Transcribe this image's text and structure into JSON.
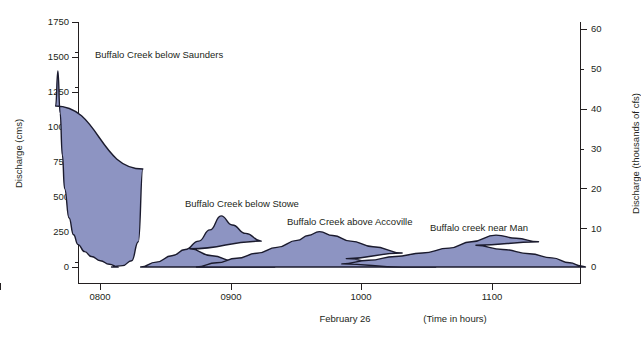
{
  "chart_data": {
    "type": "area",
    "title": "",
    "xlabel": "February 26",
    "xlabel_units": "(Time in hours)",
    "ylabel": "Discharge (cms)",
    "ylabel_right": "Discharge (thousands of cfs)",
    "xlim": [
      770,
      1155
    ],
    "ylim": [
      0,
      1750
    ],
    "ylim_right": [
      0,
      60
    ],
    "grid": false,
    "legend_position": "inline-annotations",
    "x_tick_labels": [
      "0800",
      "0900",
      "1000",
      "1100"
    ],
    "x_tick_values": [
      800,
      900,
      1000,
      1100
    ],
    "y_tick_labels": [
      "0",
      "250",
      "500",
      "750",
      "1000",
      "1250",
      "1500",
      "1750"
    ],
    "y_tick_values": [
      0,
      250,
      500,
      750,
      1000,
      1250,
      1500,
      1750
    ],
    "y_right_tick_labels": [
      "0",
      "10",
      "20",
      "30",
      "40",
      "50",
      "60"
    ],
    "y_right_tick_values": [
      0,
      10,
      20,
      30,
      40,
      50,
      60
    ],
    "fill_color": "#8d94c2",
    "line_color": "#1b1b2e",
    "series": [
      {
        "name": "Buffalo Creek below Saunders",
        "label_x": 95,
        "label_y": 49,
        "peak_time": 801,
        "peak_value": 1400,
        "points": [
          [
            785,
            0
          ],
          [
            790,
            10
          ],
          [
            794,
            45
          ],
          [
            797,
            180
          ],
          [
            799,
            700
          ],
          [
            800,
            1150
          ],
          [
            801,
            1400
          ],
          [
            802,
            1100
          ],
          [
            803,
            800
          ],
          [
            804,
            560
          ],
          [
            806,
            350
          ],
          [
            808,
            230
          ],
          [
            810,
            160
          ],
          [
            813,
            110
          ],
          [
            816,
            75
          ],
          [
            820,
            45
          ],
          [
            824,
            20
          ],
          [
            828,
            0
          ]
        ]
      },
      {
        "name": "Buffalo Creek below Stowe",
        "label_x": 185,
        "label_y": 198,
        "peak_time": 874,
        "peak_value": 365,
        "points": [
          [
            838,
            0
          ],
          [
            845,
            35
          ],
          [
            852,
            80
          ],
          [
            858,
            125
          ],
          [
            864,
            185
          ],
          [
            869,
            265
          ],
          [
            874,
            365
          ],
          [
            879,
            300
          ],
          [
            885,
            240
          ],
          [
            892,
            185
          ],
          [
            900,
            130
          ],
          [
            910,
            80
          ],
          [
            920,
            40
          ],
          [
            930,
            12
          ],
          [
            938,
            0
          ]
        ]
      },
      {
        "name": "Buffalo Creek above Accoville",
        "label_x": 287,
        "label_y": 216,
        "peak_time": 958,
        "peak_value": 253,
        "points": [
          [
            903,
            0
          ],
          [
            912,
            30
          ],
          [
            921,
            62
          ],
          [
            930,
            98
          ],
          [
            939,
            140
          ],
          [
            948,
            190
          ],
          [
            953,
            225
          ],
          [
            958,
            253
          ],
          [
            964,
            225
          ],
          [
            972,
            185
          ],
          [
            982,
            145
          ],
          [
            995,
            100
          ],
          [
            1010,
            60
          ],
          [
            1025,
            28
          ],
          [
            1040,
            8
          ],
          [
            1050,
            0
          ]
        ]
      },
      {
        "name": "Buffalo creek near Man",
        "label_x": 430,
        "label_y": 222,
        "peak_time": 1077,
        "peak_value": 228,
        "points": [
          [
            995,
            0
          ],
          [
            1008,
            22
          ],
          [
            1020,
            48
          ],
          [
            1032,
            75
          ],
          [
            1044,
            100
          ],
          [
            1056,
            135
          ],
          [
            1066,
            180
          ],
          [
            1077,
            228
          ],
          [
            1086,
            205
          ],
          [
            1096,
            180
          ],
          [
            1108,
            155
          ],
          [
            1120,
            125
          ],
          [
            1132,
            95
          ],
          [
            1142,
            65
          ],
          [
            1150,
            30
          ],
          [
            1155,
            8
          ],
          [
            1157,
            0
          ]
        ]
      }
    ]
  }
}
